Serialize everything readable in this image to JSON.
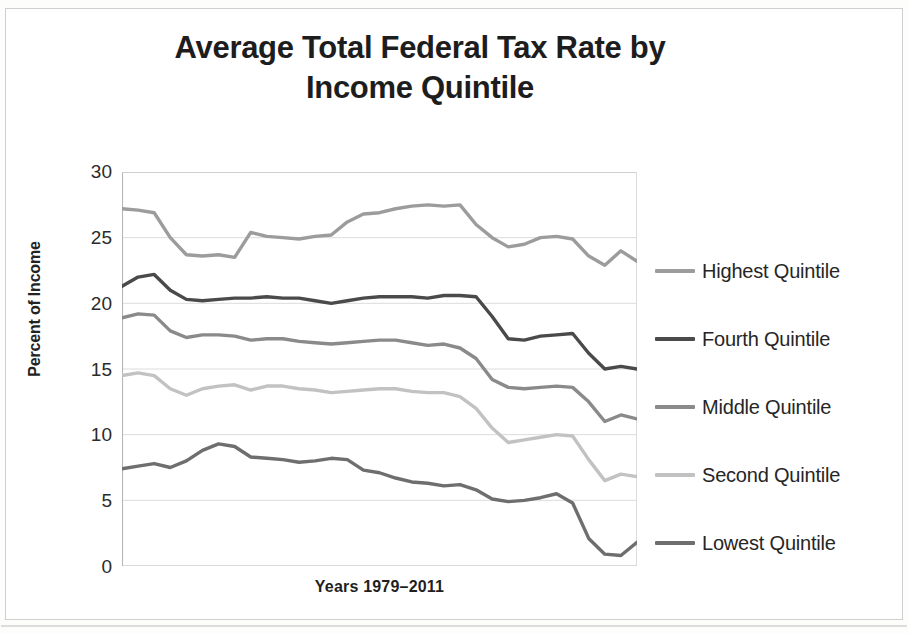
{
  "figure": {
    "title_line1": "Average Total Federal Tax Rate by",
    "title_line2": "Income Quintile"
  },
  "axes": {
    "y_title": "Percent of Income",
    "x_title": "Years 1979–2011",
    "y_ticks": [
      "30",
      "25",
      "20",
      "15",
      "10",
      "5",
      "0"
    ]
  },
  "legend": {
    "items": [
      {
        "label": "Highest Quintile",
        "color": "#9c9c9c"
      },
      {
        "label": "Fourth Quintile",
        "color": "#4a4a4a"
      },
      {
        "label": "Middle Quintile",
        "color": "#8a8a8a"
      },
      {
        "label": "Second Quintile",
        "color": "#c2c2c2"
      },
      {
        "label": "Lowest Quintile",
        "color": "#6e6e6e"
      }
    ]
  },
  "chart_data": {
    "type": "line",
    "title": "Average Total Federal Tax Rate by Income Quintile",
    "xlabel": "Years 1979–2011",
    "ylabel": "Percent of Income",
    "xlim": [
      1979,
      2011
    ],
    "ylim": [
      0,
      30
    ],
    "ytick_step": 5,
    "grid": true,
    "legend_position": "right",
    "x": [
      1979,
      1980,
      1981,
      1982,
      1983,
      1984,
      1985,
      1986,
      1987,
      1988,
      1989,
      1990,
      1991,
      1992,
      1993,
      1994,
      1995,
      1996,
      1997,
      1998,
      1999,
      2000,
      2001,
      2002,
      2003,
      2004,
      2005,
      2006,
      2007,
      2008,
      2009,
      2010,
      2011
    ],
    "series": [
      {
        "name": "Highest Quintile",
        "color": "#9c9c9c",
        "values": [
          27.2,
          27.1,
          26.9,
          25.0,
          23.7,
          23.6,
          23.7,
          23.5,
          25.4,
          25.1,
          25.0,
          24.9,
          25.1,
          25.2,
          26.2,
          26.8,
          26.9,
          27.2,
          27.4,
          27.5,
          27.4,
          27.5,
          26.0,
          25.0,
          24.3,
          24.5,
          25.0,
          25.1,
          24.9,
          23.6,
          22.9,
          24.0,
          23.2
        ]
      },
      {
        "name": "Fourth Quintile",
        "color": "#4a4a4a",
        "values": [
          21.3,
          22.0,
          22.2,
          21.0,
          20.3,
          20.2,
          20.3,
          20.4,
          20.4,
          20.5,
          20.4,
          20.4,
          20.2,
          20.0,
          20.2,
          20.4,
          20.5,
          20.5,
          20.5,
          20.4,
          20.6,
          20.6,
          20.5,
          19.0,
          17.3,
          17.2,
          17.5,
          17.6,
          17.7,
          16.2,
          15.0,
          15.2,
          15.0
        ]
      },
      {
        "name": "Middle Quintile",
        "color": "#8a8a8a",
        "values": [
          18.9,
          19.2,
          19.1,
          17.9,
          17.4,
          17.6,
          17.6,
          17.5,
          17.2,
          17.3,
          17.3,
          17.1,
          17.0,
          16.9,
          17.0,
          17.1,
          17.2,
          17.2,
          17.0,
          16.8,
          16.9,
          16.6,
          15.8,
          14.2,
          13.6,
          13.5,
          13.6,
          13.7,
          13.6,
          12.5,
          11.0,
          11.5,
          11.2
        ]
      },
      {
        "name": "Second Quintile",
        "color": "#c2c2c2",
        "values": [
          14.5,
          14.7,
          14.5,
          13.5,
          13.0,
          13.5,
          13.7,
          13.8,
          13.4,
          13.7,
          13.7,
          13.5,
          13.4,
          13.2,
          13.3,
          13.4,
          13.5,
          13.5,
          13.3,
          13.2,
          13.2,
          12.9,
          12.0,
          10.5,
          9.4,
          9.6,
          9.8,
          10.0,
          9.9,
          8.1,
          6.5,
          7.0,
          6.8
        ]
      },
      {
        "name": "Lowest Quintile",
        "color": "#6e6e6e",
        "values": [
          7.4,
          7.6,
          7.8,
          7.5,
          8.0,
          8.8,
          9.3,
          9.1,
          8.3,
          8.2,
          8.1,
          7.9,
          8.0,
          8.2,
          8.1,
          7.3,
          7.1,
          6.7,
          6.4,
          6.3,
          6.1,
          6.2,
          5.8,
          5.1,
          4.9,
          5.0,
          5.2,
          5.5,
          4.8,
          2.1,
          0.9,
          0.8,
          1.8
        ]
      }
    ]
  }
}
